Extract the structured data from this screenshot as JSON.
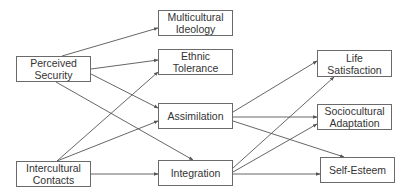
{
  "diagram": {
    "type": "path-model",
    "nodes": {
      "perceived_security": {
        "label": "Perceived\nSecurity"
      },
      "multicultural_ideology": {
        "label": "Multicultural\nIdeology"
      },
      "ethnic_tolerance": {
        "label": "Ethnic\nTolerance"
      },
      "assimilation": {
        "label": "Assimilation"
      },
      "intercultural_contacts": {
        "label": "Intercultural\nContacts"
      },
      "integration": {
        "label": "Integration"
      },
      "life_satisfaction": {
        "label": "Life\nSatisfaction"
      },
      "sociocultural_adaptation": {
        "label": "Sociocultural\nAdaptation"
      },
      "self_esteem": {
        "label": "Self-Esteem"
      }
    },
    "edges": [
      {
        "from": "Perceived Security",
        "to": "Multicultural Ideology"
      },
      {
        "from": "Perceived Security",
        "to": "Ethnic Tolerance"
      },
      {
        "from": "Perceived Security",
        "to": "Assimilation"
      },
      {
        "from": "Perceived Security",
        "to": "Integration"
      },
      {
        "from": "Intercultural Contacts",
        "to": "Ethnic Tolerance"
      },
      {
        "from": "Intercultural Contacts",
        "to": "Assimilation"
      },
      {
        "from": "Intercultural Contacts",
        "to": "Integration"
      },
      {
        "from": "Assimilation",
        "to": "Life Satisfaction"
      },
      {
        "from": "Assimilation",
        "to": "Sociocultural Adaptation"
      },
      {
        "from": "Assimilation",
        "to": "Self-Esteem"
      },
      {
        "from": "Integration",
        "to": "Life Satisfaction"
      },
      {
        "from": "Integration",
        "to": "Sociocultural Adaptation"
      },
      {
        "from": "Integration",
        "to": "Self-Esteem"
      }
    ],
    "colors": {
      "line": "#555555",
      "border": "#6a6a6a",
      "text": "#333333",
      "background": "#ffffff"
    }
  }
}
